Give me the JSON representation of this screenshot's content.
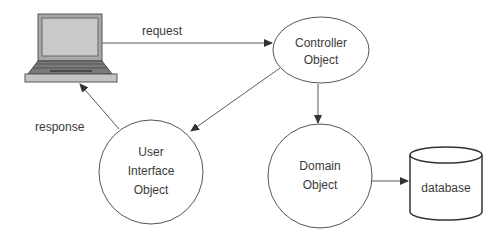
{
  "diagram": {
    "nodes": {
      "client": {
        "label": "",
        "icon": "laptop-icon"
      },
      "controller": {
        "lines": [
          "Controller",
          "Object"
        ]
      },
      "ui": {
        "lines": [
          "User",
          "Interface",
          "Object"
        ]
      },
      "domain": {
        "lines": [
          "Domain",
          "Object"
        ]
      },
      "database": {
        "label": "database"
      }
    },
    "edges": {
      "request": {
        "label": "request",
        "from": "client",
        "to": "controller"
      },
      "controller_to_ui": {
        "label": "",
        "from": "controller",
        "to": "ui"
      },
      "response": {
        "label": "response",
        "from": "ui",
        "to": "client"
      },
      "controller_to_domain": {
        "label": "",
        "from": "controller",
        "to": "domain"
      },
      "domain_to_database": {
        "label": "",
        "from": "domain",
        "to": "database"
      }
    },
    "colors": {
      "stroke": "#555555",
      "text": "#3a3a3a",
      "laptop_screen": "#c9c9c9",
      "laptop_frame": "#9a9a9a",
      "laptop_keyboard": "#6e6e6e"
    }
  }
}
